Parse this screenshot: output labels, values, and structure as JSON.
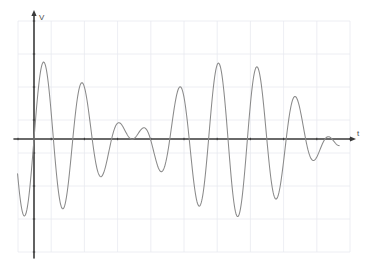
{
  "figure": {
    "kind": "oscilloscope-waveform-plot",
    "background_color": "#ffffff",
    "axis_color": "#3a3a3a",
    "curve_color": "#8a8a8a",
    "grid_color": "#e8eaf0",
    "grid_major_color": "#dfe2ea"
  },
  "axes": {
    "y_axis_label": "V",
    "x_axis_label": "t",
    "y_axis_x_px": 34,
    "x_axis_y_px": 139,
    "has_arrowheads": true,
    "tick_marks_visible": true
  },
  "grid": {
    "left_px": 18,
    "right_px": 350,
    "top_px": 21,
    "bottom_px": 252,
    "columns": 10,
    "rows": 7,
    "visible": true
  },
  "chart_data": {
    "type": "line",
    "title": "",
    "subtitle": "",
    "xlabel": "t",
    "ylabel": "V",
    "legend": [],
    "grid": true,
    "legend_position": "none",
    "xlim": [
      -0.5,
      10.0
    ],
    "ylim": [
      -3.5,
      3.5
    ],
    "annotations": [],
    "series": [
      {
        "name": "v(t)",
        "color": "#8a8a8a",
        "model": "beat",
        "formula": "v(t) = A*sin(w1*t) + A*sin(w2*t)",
        "amplitude": 1.18,
        "omega1": 4.62,
        "omega2": 5.62,
        "phase1": 0.0,
        "phase2": 0.0,
        "t_start": -0.52,
        "t_end": 9.65,
        "samples": 620
      }
    ],
    "x_tick_labels": [],
    "y_tick_labels": [],
    "envelope_nodes_t": [
      3.14,
      9.42
    ],
    "envelope_antinodes_t": [
      0.0,
      6.28
    ],
    "peak_count_visible": 11,
    "trough_count_visible": 11
  }
}
